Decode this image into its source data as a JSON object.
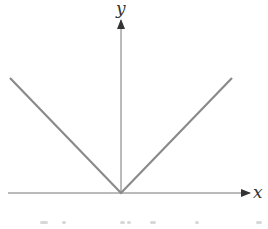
{
  "chart_data": {
    "type": "line",
    "title": "",
    "function": "y = |x|",
    "xlabel": "x",
    "ylabel": "y",
    "series": [
      {
        "name": "y = |x|",
        "x": [
          -1,
          0,
          1
        ],
        "values": [
          1,
          0,
          1
        ],
        "color": "#8a8a8a"
      }
    ],
    "xlim": [
      -1,
      1
    ],
    "ylim": [
      0,
      1
    ],
    "grid": false,
    "legend": "none",
    "ticks": false,
    "axes_color": "#555555",
    "line_color": "#8a8a8a"
  },
  "figure": {
    "x_axis_label": "x",
    "y_axis_label": "y",
    "caption_visible": "clipped (illegible)"
  }
}
